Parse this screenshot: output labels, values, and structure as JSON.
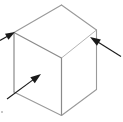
{
  "figure": {
    "name": "isometric-cube-with-annotation-arrows",
    "width": 123,
    "height": 122,
    "background_color": "#ffffff",
    "labels": {
      "title": "",
      "caption": ""
    }
  },
  "style": {
    "edge_color": "#9a9a9a",
    "edge_color_dark": "#8a8a8a",
    "edge_width": 1.1,
    "arrow_color": "#1a1a1a",
    "arrow_width": 1.1,
    "speck_color": "#c8c8c8"
  },
  "cube": {
    "type": "wireframe-cube",
    "projection": "isometric",
    "vertices": {
      "top": [
        61.5,
        5.0
      ],
      "left_top": [
        14.0,
        32.5
      ],
      "right_top": [
        96.5,
        30.0
      ],
      "center": [
        61.5,
        58.0
      ],
      "left_bottom": [
        14.0,
        92.0
      ],
      "right_bottom": [
        96.5,
        89.5
      ],
      "bottom": [
        61.5,
        115.5
      ]
    },
    "edges": [
      {
        "name": "top-to-left-top",
        "from": "top",
        "to": "left_top"
      },
      {
        "name": "top-to-right-top",
        "from": "top",
        "to": "right_top"
      },
      {
        "name": "left-top-to-center",
        "from": "left_top",
        "to": "center"
      },
      {
        "name": "right-top-to-center",
        "from": "right_top",
        "to": "center"
      },
      {
        "name": "left-vertical",
        "from": "left_top",
        "to": "left_bottom"
      },
      {
        "name": "right-vertical",
        "from": "right_top",
        "to": "right_bottom"
      },
      {
        "name": "center-vertical",
        "from": "center",
        "to": "bottom"
      },
      {
        "name": "left-bottom-to-bottom",
        "from": "left_bottom",
        "to": "bottom"
      },
      {
        "name": "right-bottom-to-bottom",
        "from": "right_bottom",
        "to": "bottom"
      }
    ]
  },
  "arrows": [
    {
      "id": "arrow-upper-left",
      "name": "arrow-pointing-left-top-vertex",
      "tail": [
        0.0,
        40.5
      ],
      "tip": [
        15.0,
        32.0
      ],
      "head_length": 9.5,
      "head_width": 7.0,
      "direction": "up-right",
      "target": "left_top vertex"
    },
    {
      "id": "arrow-lower-left",
      "name": "arrow-pointing-left-face",
      "tail": [
        7.0,
        99.0
      ],
      "tip": [
        41.0,
        74.0
      ],
      "head_length": 10.5,
      "head_width": 7.5,
      "direction": "up-right",
      "target": "left face interior"
    },
    {
      "id": "arrow-right",
      "name": "arrow-pointing-right-top-edge",
      "tail": [
        121.0,
        56.5
      ],
      "tip": [
        90.0,
        37.0
      ],
      "head_length": 10.5,
      "head_width": 7.5,
      "direction": "up-left",
      "target": "right-top edge region"
    }
  ],
  "marks": [
    {
      "id": "speck-bottom-left",
      "name": "stray-speck",
      "x": 2.0,
      "y": 112.0,
      "size": 2.0
    }
  ]
}
